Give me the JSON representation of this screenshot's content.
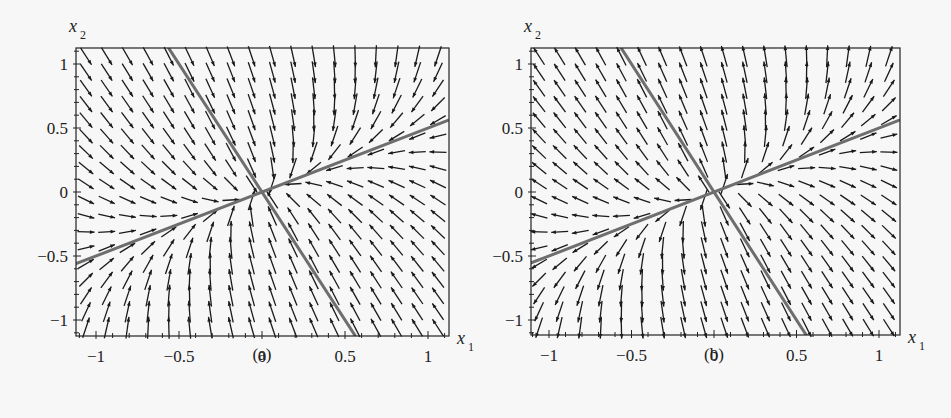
{
  "chart_data": [
    {
      "type": "vector_field",
      "panel_label": "(a)",
      "behavior": "stable node (sink) - arrows point toward origin",
      "xlabel": "x1",
      "ylabel": "x2",
      "xlim": [
        -1.12,
        1.12
      ],
      "ylim": [
        -1.12,
        1.12
      ],
      "x_ticks": [
        -1,
        -0.5,
        0,
        0.5,
        1
      ],
      "x_tick_labels": [
        "−1",
        "−0.5",
        "0",
        "0.5",
        "1"
      ],
      "y_ticks": [
        -1,
        -0.5,
        0,
        0.5,
        1
      ],
      "y_tick_labels": [
        "−1",
        "−0.5",
        "0",
        "0.5",
        "1"
      ],
      "eigenlines": [
        {
          "direction": [
            1,
            -2
          ],
          "slope": -2,
          "from": [
            -0.56,
            1.12
          ],
          "to": [
            0.56,
            -1.12
          ]
        },
        {
          "direction": [
            2,
            1
          ],
          "slope": 0.5,
          "from": [
            -1.12,
            -0.56
          ],
          "to": [
            1.12,
            0.56
          ]
        }
      ],
      "eigenvalues": [
        -3,
        -1
      ],
      "grid": {
        "n": 18,
        "from": -1.06,
        "to": 1.06
      }
    },
    {
      "type": "vector_field",
      "panel_label": "(b)",
      "behavior": "unstable node (source) - arrows point away from origin",
      "xlabel": "x1",
      "ylabel": "x2",
      "xlim": [
        -1.12,
        1.12
      ],
      "ylim": [
        -1.12,
        1.12
      ],
      "x_ticks": [
        -1,
        -0.5,
        0,
        0.5,
        1
      ],
      "x_tick_labels": [
        "−1",
        "−0.5",
        "0",
        "0.5",
        "1"
      ],
      "y_ticks": [
        -1,
        -0.5,
        0,
        0.5,
        1
      ],
      "y_tick_labels": [
        "−1",
        "−0.5",
        "0",
        "0.5",
        "1"
      ],
      "eigenlines": [
        {
          "direction": [
            1,
            -2
          ],
          "slope": -2,
          "from": [
            -0.56,
            1.12
          ],
          "to": [
            0.56,
            -1.12
          ]
        },
        {
          "direction": [
            2,
            1
          ],
          "slope": 0.5,
          "from": [
            -1.12,
            -0.56
          ],
          "to": [
            1.12,
            0.56
          ]
        }
      ],
      "eigenvalues": [
        3,
        1
      ],
      "grid": {
        "n": 18,
        "from": -1.06,
        "to": 1.06
      }
    }
  ],
  "colors": {
    "arrow": "#1a1a1a",
    "eigenline": "#6e6e6e",
    "frame": "#222222",
    "background": "#f7f7f7"
  }
}
